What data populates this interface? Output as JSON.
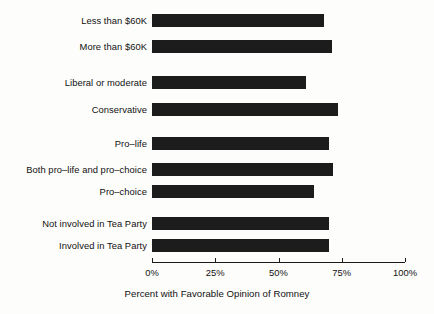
{
  "chart_data": {
    "type": "bar",
    "orientation": "horizontal",
    "title": "",
    "xlabel": "Percent with Favorable Opinion of Romney",
    "ylabel": "",
    "xlim": [
      0,
      100
    ],
    "xticks": [
      0,
      25,
      50,
      75,
      100
    ],
    "xtick_labels": [
      "0%",
      "25%",
      "50%",
      "75%",
      "100%"
    ],
    "grid": false,
    "legend": null,
    "bar_color": "#1c1c1c",
    "background_color": "#fdfdfb",
    "categories": [
      "Less than $60K",
      "More than $60K",
      "Liberal or moderate",
      "Conservative",
      "Pro–life",
      "Both pro–life and pro–choice",
      "Pro–choice",
      "Not involved in Tea Party",
      "Involved in Tea Party"
    ],
    "values": [
      68,
      71,
      61,
      73.5,
      70,
      71.5,
      64,
      70,
      70
    ],
    "groups": [
      {
        "name": "Income",
        "indices": [
          0,
          1
        ]
      },
      {
        "name": "Ideology",
        "indices": [
          2,
          3
        ]
      },
      {
        "name": "Abortion position",
        "indices": [
          4,
          5,
          6
        ]
      },
      {
        "name": "Tea Party",
        "indices": [
          7,
          8
        ]
      }
    ],
    "bars": [
      {
        "label": "Less than $60K",
        "value": 68,
        "y": 14,
        "group": 0
      },
      {
        "label": "More than $60K",
        "value": 71,
        "y": 40,
        "group": 0
      },
      {
        "label": "Liberal or moderate",
        "value": 61,
        "y": 76,
        "group": 1
      },
      {
        "label": "Conservative",
        "value": 73.5,
        "y": 103,
        "group": 1
      },
      {
        "label": "Pro–life",
        "value": 70,
        "y": 137,
        "group": 2
      },
      {
        "label": "Both pro–life and pro–choice",
        "value": 71.5,
        "y": 163,
        "group": 2
      },
      {
        "label": "Pro–choice",
        "value": 64,
        "y": 185,
        "group": 2
      },
      {
        "label": "Not involved in Tea Party",
        "value": 70,
        "y": 217,
        "group": 3
      },
      {
        "label": "Involved in Tea Party",
        "value": 70,
        "y": 239,
        "group": 3
      }
    ]
  }
}
